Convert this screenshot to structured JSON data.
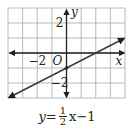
{
  "chart_data": {
    "type": "line",
    "title": "",
    "equation": "y = 1/2 x - 1",
    "slope": 0.5,
    "intercept": -1,
    "xlabel": "x",
    "ylabel": "y",
    "origin_label": "O",
    "xlim": [
      -4,
      4
    ],
    "ylim": [
      -3,
      3
    ],
    "grid": true,
    "x_tick_labels": [
      {
        "value": -2,
        "label": "−2"
      }
    ],
    "y_tick_labels": [
      {
        "value": 2,
        "label": "2"
      },
      {
        "value": -2,
        "label": "−2"
      }
    ],
    "series": [
      {
        "name": "y = 1/2 x - 1",
        "x": [
          -4,
          0,
          2,
          4
        ],
        "y": [
          -3,
          -1,
          0,
          1
        ],
        "arrows": "both"
      }
    ],
    "points": [
      {
        "x": 0,
        "y": -1,
        "label": "y-intercept"
      }
    ],
    "legend": null
  },
  "caption": {
    "lhs": "y",
    "eq": "=",
    "frac_num": "1",
    "frac_den": "2",
    "var": "x",
    "rest": "−1"
  },
  "colors": {
    "grid": "#a8a8a8",
    "axis": "#222222",
    "line": "#3a3a3a",
    "text": "#222222"
  }
}
